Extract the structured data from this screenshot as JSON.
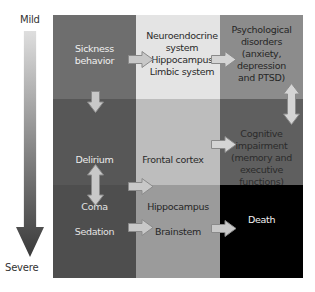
{
  "scale": {
    "top_label": "Mild",
    "bottom_label": "Severe"
  },
  "grid": {
    "cells": [
      {
        "row": 0,
        "col": 0,
        "text": "Sickness\nbehavior",
        "bg": "#6e6e6e",
        "fg": "#f0f0f0"
      },
      {
        "row": 0,
        "col": 1,
        "text": "Neuroendocrine\nsystem\nHippocampus\nLimbic system",
        "bg": "#e4e4e4",
        "fg": "#2a2a2a"
      },
      {
        "row": 0,
        "col": 2,
        "text": "Psychological\ndisorders\n(anxiety,\ndepression\nand PTSD)",
        "bg": "#8c8c8c",
        "fg": "#262626"
      },
      {
        "row": 1,
        "col": 0,
        "text": "Delirium",
        "bg": "#575757",
        "fg": "#ececec"
      },
      {
        "row": 1,
        "col": 1,
        "text": "Frontal cortex",
        "bg": "#bdbdbd",
        "fg": "#2a2a2a"
      },
      {
        "row": 1,
        "col": 2,
        "text": "Cognitive\nimpairment\n(memory and\nexecutive\nfunctions)",
        "bg": "#5f5f5f",
        "fg": "#2b2b2b"
      },
      {
        "row": 2,
        "col": 0,
        "text": "Coma\n\nSedation",
        "bg": "#4e4e4e",
        "fg": "#e4e4e4"
      },
      {
        "row": 2,
        "col": 1,
        "text": "Hippocampus\n\nBrainstem",
        "bg": "#9b9b9b",
        "fg": "#262626"
      },
      {
        "row": 2,
        "col": 2,
        "text": "Death",
        "bg": "#000000",
        "fg": "#f2f2f2"
      }
    ]
  },
  "arrows": [
    {
      "id": "sickness-to-neuro",
      "direction": "right"
    },
    {
      "id": "neuro-to-psych",
      "direction": "right"
    },
    {
      "id": "sickness-to-delirium",
      "direction": "down"
    },
    {
      "id": "delirium-coma",
      "direction": "up-down"
    },
    {
      "id": "delirium-to-frontal",
      "direction": "right"
    },
    {
      "id": "frontal-to-cognitive",
      "direction": "right"
    },
    {
      "id": "psych-cognitive",
      "direction": "up-down"
    },
    {
      "id": "coma-to-hippocampus",
      "direction": "right"
    },
    {
      "id": "hippocampus-to-death",
      "direction": "right"
    }
  ],
  "colors": {
    "arrow_fill": "#c8c8c8",
    "arrow_stroke": "#8a8a8a",
    "scale_top": "#dcdcdc",
    "scale_bottom": "#3c3c3c"
  }
}
